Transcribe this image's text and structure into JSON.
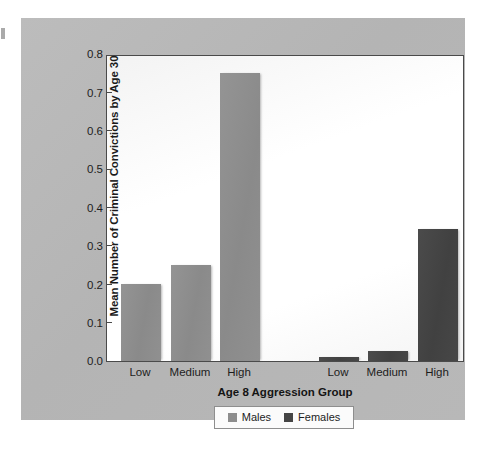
{
  "chart_data": {
    "type": "bar",
    "title": "",
    "xlabel": "Age 8 Aggression Group",
    "ylabel": "Mean Number of Criminal Convictions by Age 30",
    "categories": [
      "Low",
      "Medium",
      "High"
    ],
    "ylim": [
      0.0,
      0.8
    ],
    "ytick_labels": [
      "0.8",
      "0.7",
      "0.6",
      "0.5",
      "0.4",
      "0.3",
      "0.2",
      "0.1",
      "0.0"
    ],
    "ytick_values": [
      0.8,
      0.7,
      0.6,
      0.5,
      0.4,
      0.3,
      0.2,
      0.1,
      0.0
    ],
    "grid": false,
    "legend_position": "bottom-center",
    "series": [
      {
        "name": "Males",
        "color": "#8d8d8d",
        "values": [
          0.2,
          0.25,
          0.75
        ]
      },
      {
        "name": "Females",
        "color": "#454545",
        "values": [
          0.01,
          0.025,
          0.345
        ]
      }
    ],
    "bars": [
      {
        "series": "Males",
        "category": "Low",
        "value": 0.2,
        "label": "Low"
      },
      {
        "series": "Males",
        "category": "Medium",
        "value": 0.25,
        "label": "Medium"
      },
      {
        "series": "Males",
        "category": "High",
        "value": 0.75,
        "label": "High"
      },
      {
        "series": "Females",
        "category": "Low",
        "value": 0.01,
        "label": "Low"
      },
      {
        "series": "Females",
        "category": "Medium",
        "value": 0.025,
        "label": "Medium"
      },
      {
        "series": "Females",
        "category": "High",
        "value": 0.345,
        "label": "High"
      }
    ]
  },
  "legend": {
    "entries": [
      {
        "label": "Males",
        "color": "#8d8d8d"
      },
      {
        "label": "Females",
        "color": "#454545"
      }
    ]
  },
  "colors": {
    "panel_background": "#b7b7b7",
    "plot_background": "#fdfdfd",
    "axis": "#4a4a4a",
    "males": "#8d8d8d",
    "females": "#454545"
  }
}
